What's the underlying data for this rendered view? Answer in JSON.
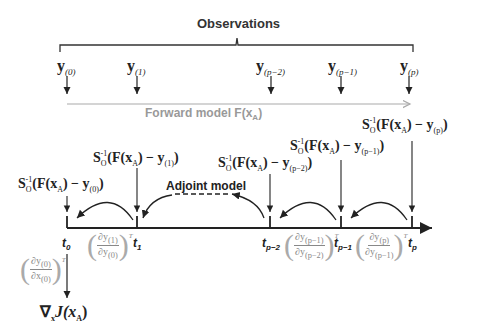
{
  "title": "Observations",
  "observations": [
    {
      "symbol": "y",
      "subscript": "(0)"
    },
    {
      "symbol": "y",
      "subscript": "(1)"
    },
    {
      "symbol": "y",
      "subscript": "(p−2)"
    },
    {
      "symbol": "y",
      "subscript": "(p−1)"
    },
    {
      "symbol": "y",
      "subscript": "(p)"
    }
  ],
  "forward_model": {
    "label": "Forward model F(x",
    "sub": "A",
    "close": ")"
  },
  "adjoint_model": {
    "label": "Adjoint model"
  },
  "forcings": [
    {
      "prefix": "S",
      "o": "O",
      "sup": "-1",
      "mid": "(F(x",
      "A": "A",
      "rest": ") − y",
      "sub": "(0)",
      "end": ")"
    },
    {
      "prefix": "S",
      "o": "O",
      "sup": "-1",
      "mid": "(F(x",
      "A": "A",
      "rest": ") − y",
      "sub": "(1)",
      "end": ")"
    },
    {
      "prefix": "S",
      "o": "O",
      "sup": "-1",
      "mid": "(F(x",
      "A": "A",
      "rest": ") − y",
      "sub": "(p−2)",
      "end": ")"
    },
    {
      "prefix": "S",
      "o": "O",
      "sup": "-1",
      "mid": "(F(x",
      "A": "A",
      "rest": ") − y",
      "sub": "(p−1)",
      "end": ")"
    },
    {
      "prefix": "S",
      "o": "O",
      "sup": "-1",
      "mid": "(F(x",
      "A": "A",
      "rest": ") − y",
      "sub": "(p)",
      "end": ")"
    }
  ],
  "times": [
    {
      "t": "t",
      "sub": "0"
    },
    {
      "t": "t",
      "sub": "1"
    },
    {
      "t": "t",
      "sub": "p−2"
    },
    {
      "t": "t",
      "sub": "p−1"
    },
    {
      "t": "t",
      "sub": "p"
    }
  ],
  "jacobians": [
    {
      "num": "∂y",
      "num_sub": "(0)",
      "den": "∂x",
      "den_sub": "(0)",
      "T": "T"
    },
    {
      "num": "∂y",
      "num_sub": "(1)",
      "den": "∂y",
      "den_sub": "(0)",
      "T": "T"
    },
    {
      "num": "∂y",
      "num_sub": "(p−1)",
      "den": "∂y",
      "den_sub": "(p−2)",
      "T": "T"
    },
    {
      "num": "∂y",
      "num_sub": "(p)",
      "den": "∂y",
      "den_sub": "(p−1)",
      "T": "T"
    }
  ],
  "gradient": {
    "nabla": "∇",
    "x": "x",
    "J": "J(x",
    "A": "A",
    "end": ")"
  },
  "colors": {
    "ink": "#222222",
    "forward_arrow": "#aaaaaa",
    "forward_label": "#999999",
    "jacobian": "#888888"
  }
}
